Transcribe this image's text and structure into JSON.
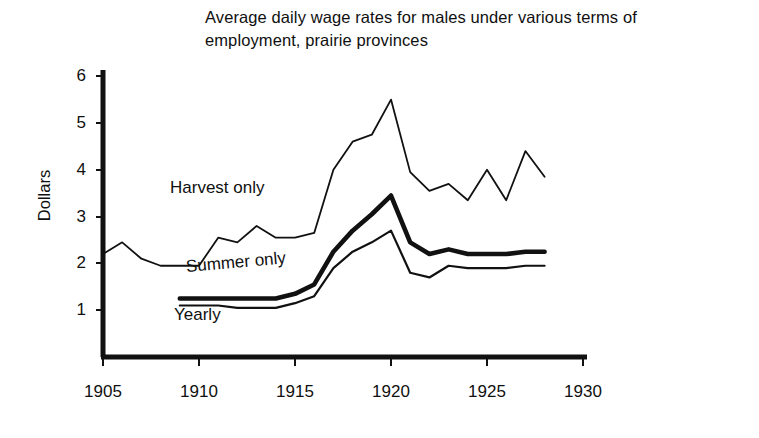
{
  "figure": {
    "title": "Average daily wage rates for males under various terms of employment, prairie provinces",
    "ylabel": "Dollars"
  },
  "axis": {
    "y_ticks": [
      "1",
      "2",
      "3",
      "4",
      "5",
      "6"
    ],
    "x_ticks": [
      "1905",
      "1910",
      "1915",
      "1920",
      "1925",
      "1930"
    ]
  },
  "labels": {
    "harvest": "Harvest only",
    "summer": "Summer only",
    "yearly": "Yearly"
  },
  "chart_data": {
    "type": "line",
    "title": "Average daily wage rates for males under various terms of employment, prairie provinces",
    "xlabel": "",
    "ylabel": "Dollars",
    "xlim": [
      1905,
      1930
    ],
    "ylim": [
      0,
      6
    ],
    "xticks": [
      1905,
      1910,
      1915,
      1920,
      1925,
      1930
    ],
    "yticks": [
      1,
      2,
      3,
      4,
      5,
      6
    ],
    "grid": false,
    "legend": "inline-annotations",
    "series": [
      {
        "name": "Harvest only",
        "style": "thin",
        "x": [
          1905,
          1906,
          1907,
          1908,
          1909,
          1910,
          1911,
          1912,
          1913,
          1914,
          1915,
          1916,
          1917,
          1918,
          1919,
          1920,
          1921,
          1922,
          1923,
          1924,
          1925,
          1926,
          1927,
          1928
        ],
        "y": [
          2.2,
          2.45,
          2.1,
          1.95,
          1.95,
          1.95,
          2.55,
          2.45,
          2.8,
          2.55,
          2.55,
          2.65,
          4.0,
          4.6,
          4.75,
          5.5,
          3.95,
          3.55,
          3.7,
          3.35,
          4.0,
          3.35,
          4.4,
          3.85
        ]
      },
      {
        "name": "Summer only",
        "style": "thick",
        "x": [
          1909,
          1910,
          1911,
          1912,
          1913,
          1914,
          1915,
          1916,
          1917,
          1918,
          1919,
          1920,
          1921,
          1922,
          1923,
          1924,
          1925,
          1926,
          1927,
          1928
        ],
        "y": [
          1.25,
          1.25,
          1.25,
          1.25,
          1.25,
          1.25,
          1.35,
          1.55,
          2.25,
          2.7,
          3.05,
          3.45,
          2.45,
          2.2,
          2.3,
          2.2,
          2.2,
          2.2,
          2.25,
          2.25
        ]
      },
      {
        "name": "Yearly",
        "style": "thin",
        "x": [
          1909,
          1910,
          1911,
          1912,
          1913,
          1914,
          1915,
          1916,
          1917,
          1918,
          1919,
          1920,
          1921,
          1922,
          1923,
          1924,
          1925,
          1926,
          1927,
          1928
        ],
        "y": [
          1.1,
          1.1,
          1.1,
          1.05,
          1.05,
          1.05,
          1.15,
          1.3,
          1.9,
          2.25,
          2.45,
          2.7,
          1.8,
          1.7,
          1.95,
          1.9,
          1.9,
          1.9,
          1.95,
          1.95
        ]
      }
    ]
  }
}
